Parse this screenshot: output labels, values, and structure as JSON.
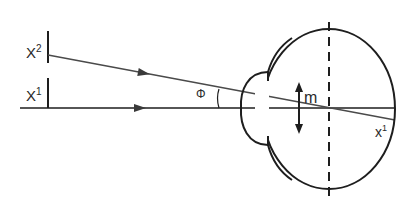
{
  "diagram": {
    "labels": {
      "x2": {
        "base": "X",
        "sup": "2"
      },
      "x1_left": {
        "base": "X",
        "sup": "1"
      },
      "phi": "Φ",
      "m": "m",
      "x1_retina": {
        "base": "x",
        "sup": "1"
      }
    },
    "colors": {
      "stroke": "#1e1e1e",
      "ray": "#4a4a4a",
      "background": "#ffffff"
    }
  }
}
